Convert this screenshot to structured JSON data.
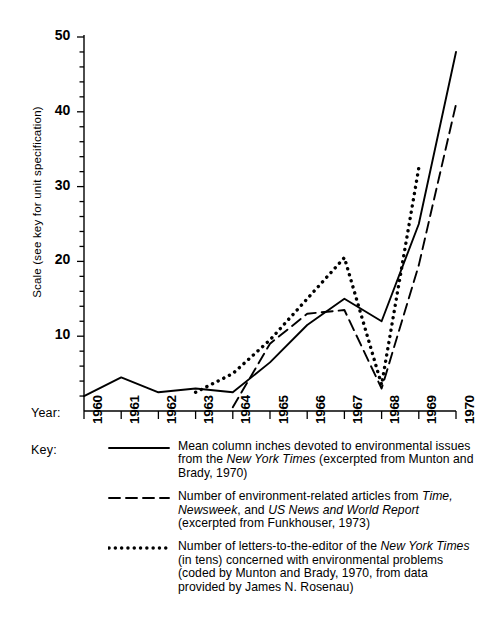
{
  "axes": {
    "y_axis_title": "Scale (see key for unit specification)",
    "y_ticks": [
      "10",
      "20",
      "30",
      "40",
      "50"
    ],
    "year_row_label": "Year:",
    "key_row_label": "Key:",
    "x_ticks": [
      "1960",
      "1961",
      "1962",
      "1963",
      "1964",
      "1965",
      "1966",
      "1967",
      "1968",
      "1969",
      "1970"
    ]
  },
  "key": {
    "entries": [
      {
        "style": "solid",
        "text_html": "Mean column inches devoted to environmental issues from the <i>New York Times</i> (excerpted from Munton and Brady, 1970)"
      },
      {
        "style": "dashed",
        "text_html": "Number of environment-related articles from <i>Time, Newsweek</i>, and <i>US News and World Report</i> (excerpted from Funkhouser, 1973)"
      },
      {
        "style": "dotted",
        "text_html": "Number of letters-to-the-editor of the <i>New York Times</i> (in tens) concerned with environmental problems (coded by Munton and Brady, 1970, from data provided by James N. Rosenau)"
      }
    ]
  },
  "chart_data": {
    "type": "line",
    "title": "",
    "xlabel": "Year",
    "ylabel": "Scale (see key for unit specification)",
    "x": [
      1960,
      1961,
      1962,
      1963,
      1964,
      1965,
      1966,
      1967,
      1968,
      1969,
      1970
    ],
    "xlim": [
      1960,
      1970
    ],
    "ylim": [
      0,
      50
    ],
    "y_tick_values": [
      10,
      20,
      30,
      40,
      50
    ],
    "y_minor_tick_step": 2,
    "grid": false,
    "legend_position": "below-plot",
    "series": [
      {
        "name": "Mean column inches devoted to environmental issues from the New York Times",
        "style": "solid",
        "color": "#000000",
        "x": [
          1960,
          1961,
          1962,
          1963,
          1964,
          1965,
          1966,
          1967,
          1968,
          1969,
          1970
        ],
        "values": [
          2,
          4.5,
          2.5,
          3,
          2.5,
          6.5,
          11.5,
          15,
          12,
          25,
          48
        ]
      },
      {
        "name": "Number of environment-related articles from Time, Newsweek, and US News and World Report",
        "style": "dashed",
        "color": "#000000",
        "x": [
          1964,
          1965,
          1966,
          1967,
          1968,
          1969,
          1970
        ],
        "values": [
          0.5,
          9,
          13,
          13.5,
          3,
          19.5,
          41
        ]
      },
      {
        "name": "Number of letters-to-the-editor of the New York Times (in tens) concerned with environmental problems",
        "style": "dotted",
        "color": "#000000",
        "x": [
          1963,
          1964,
          1965,
          1966,
          1967,
          1968,
          1969
        ],
        "values": [
          2.5,
          5,
          9.5,
          15,
          20.5,
          3.5,
          32.5
        ]
      }
    ]
  }
}
